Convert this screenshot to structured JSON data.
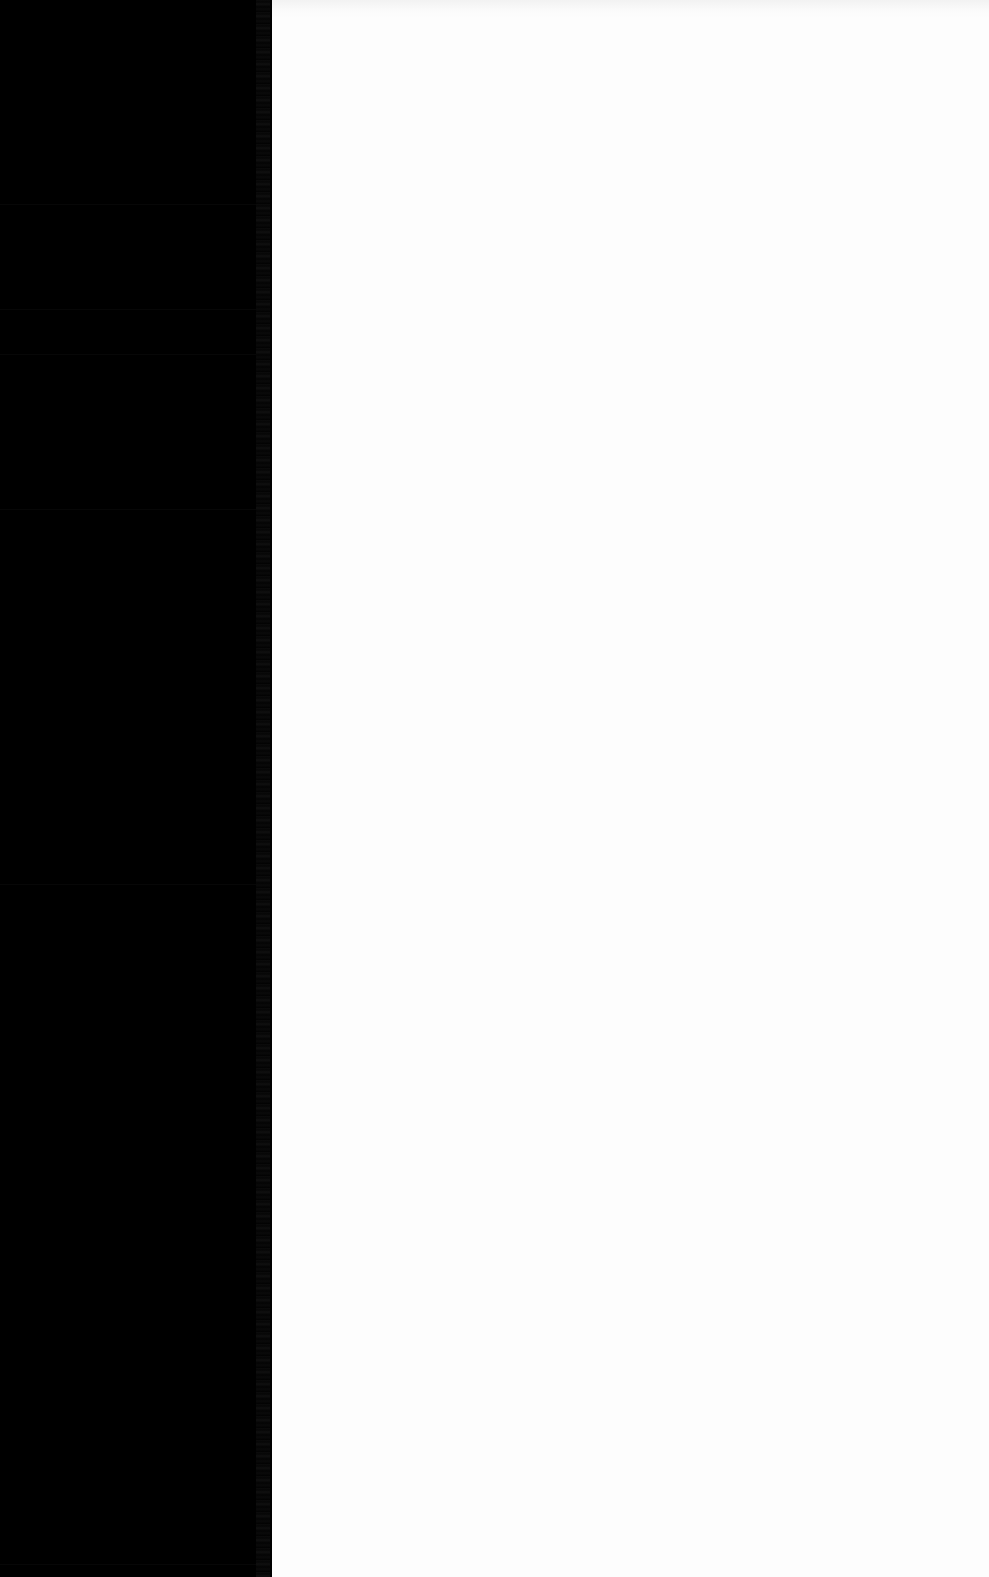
{
  "window": {
    "width": 989,
    "height": 1577,
    "background_color": "#fdfdfd",
    "note_visible": false
  },
  "sidebar": {
    "background_color": "#000000",
    "text_color": "#0a0a0a",
    "width_px": 272,
    "edge_strip_label": "",
    "items": [
      {
        "label": "",
        "top": 0,
        "height": 205
      },
      {
        "label": "",
        "top": 205,
        "height": 105
      },
      {
        "label": "",
        "top": 310,
        "height": 45
      },
      {
        "label": "",
        "top": 355,
        "height": 155
      },
      {
        "label": "",
        "top": 510,
        "height": 375
      },
      {
        "label": "",
        "top": 885,
        "height": 680
      },
      {
        "label": "",
        "top": 1565,
        "height": 12
      }
    ]
  },
  "content": {
    "background_color": "#fdfdfd",
    "top_band_color": "#f2f2f2",
    "faint_row": {
      "top": 824,
      "segments": [
        {
          "text": "",
          "dim": false
        },
        {
          "text": "",
          "dim": true
        },
        {
          "text": "",
          "dim": false
        },
        {
          "text": "",
          "dim": true
        },
        {
          "text": "",
          "dim": false
        },
        {
          "text": "",
          "dim": true
        }
      ]
    }
  }
}
